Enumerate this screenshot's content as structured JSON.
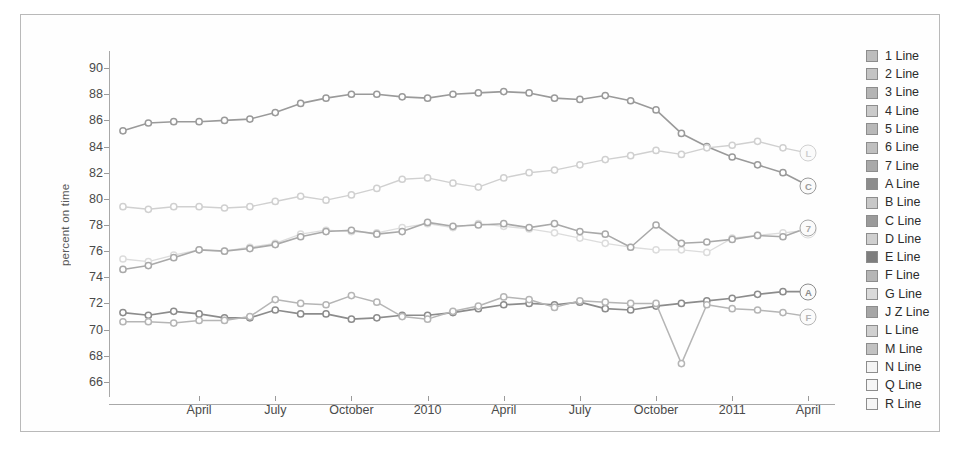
{
  "chart_data": {
    "type": "line",
    "title": "",
    "xlabel": "",
    "ylabel": "percent on time",
    "ylim": [
      65,
      91
    ],
    "yticks": [
      66,
      68,
      70,
      72,
      74,
      76,
      78,
      80,
      82,
      84,
      86,
      88,
      90
    ],
    "grid": false,
    "legend_position": "right",
    "x_tick_labels": [
      "April",
      "July",
      "October",
      "2010",
      "April",
      "July",
      "October",
      "2011",
      "April"
    ],
    "x_tick_months": [
      3,
      6,
      9,
      12,
      15,
      18,
      21,
      24,
      27
    ],
    "x": [
      "Jan 2009",
      "Feb 2009",
      "Mar 2009",
      "Apr 2009",
      "May 2009",
      "Jun 2009",
      "Jul 2009",
      "Aug 2009",
      "Sep 2009",
      "Oct 2009",
      "Nov 2009",
      "Dec 2009",
      "Jan 2010",
      "Feb 2010",
      "Mar 2010",
      "Apr 2010",
      "May 2010",
      "Jun 2010",
      "Jul 2010",
      "Aug 2010",
      "Sep 2010",
      "Oct 2010",
      "Nov 2010",
      "Dec 2010",
      "Jan 2011",
      "Feb 2011",
      "Mar 2011",
      "Apr 2011"
    ],
    "series": [
      {
        "name": "C Line",
        "end_label": "C",
        "color": "#9a9a9a",
        "width": 1.6,
        "values": [
          85.2,
          85.8,
          85.9,
          85.9,
          86.0,
          86.1,
          86.6,
          87.3,
          87.7,
          88.0,
          88.0,
          87.8,
          87.7,
          88.0,
          88.1,
          88.2,
          88.1,
          87.7,
          87.6,
          87.9,
          87.5,
          86.8,
          85.0,
          84.0,
          83.2,
          82.6,
          82.0,
          81.0
        ]
      },
      {
        "name": "L Line",
        "end_label": "L",
        "color": "#d0d0d0",
        "width": 1.4,
        "values": [
          79.4,
          79.2,
          79.4,
          79.4,
          79.3,
          79.4,
          79.8,
          80.2,
          79.9,
          80.3,
          80.8,
          81.5,
          81.6,
          81.2,
          80.9,
          81.6,
          82.0,
          82.2,
          82.6,
          83.0,
          83.3,
          83.7,
          83.4,
          83.9,
          84.1,
          84.4,
          83.9,
          83.5
        ]
      },
      {
        "name": "M Line",
        "end_label": "M",
        "color": "#dcdcdc",
        "width": 1.3,
        "values": [
          75.4,
          75.2,
          75.7,
          76.1,
          76.0,
          76.3,
          76.6,
          77.3,
          77.6,
          77.5,
          77.4,
          77.8,
          78.1,
          77.8,
          78.1,
          77.9,
          77.7,
          77.4,
          77.0,
          76.6,
          76.3,
          76.1,
          76.1,
          75.9,
          77.0,
          77.2,
          77.4,
          77.6
        ]
      },
      {
        "name": "7 Line",
        "end_label": "7",
        "color": "#a9a9a9",
        "width": 1.6,
        "values": [
          74.6,
          74.9,
          75.5,
          76.1,
          76.0,
          76.2,
          76.5,
          77.1,
          77.5,
          77.6,
          77.3,
          77.5,
          78.2,
          77.9,
          78.0,
          78.1,
          77.8,
          78.1,
          77.5,
          77.3,
          76.3,
          78.0,
          76.6,
          76.7,
          76.9,
          77.2,
          77.1,
          77.8
        ]
      },
      {
        "name": "A Line",
        "end_label": "A",
        "color": "#8c8c8c",
        "width": 1.7,
        "values": [
          71.3,
          71.1,
          71.4,
          71.2,
          70.9,
          70.9,
          71.5,
          71.2,
          71.2,
          70.8,
          70.9,
          71.1,
          71.1,
          71.3,
          71.6,
          71.9,
          72.0,
          71.9,
          72.1,
          71.6,
          71.5,
          71.8,
          72.0,
          72.2,
          72.4,
          72.7,
          72.9,
          72.9
        ]
      },
      {
        "name": "F Line",
        "end_label": "F",
        "color": "#b5b5b5",
        "width": 1.5,
        "values": [
          70.6,
          70.6,
          70.5,
          70.7,
          70.7,
          71.0,
          72.3,
          72.0,
          71.9,
          72.6,
          72.1,
          71.0,
          70.8,
          71.4,
          71.8,
          72.5,
          72.3,
          71.7,
          72.2,
          72.1,
          72.0,
          72.0,
          67.4,
          71.9,
          71.6,
          71.5,
          71.3,
          71.0
        ]
      }
    ]
  },
  "legend": {
    "items": [
      {
        "label": "1 Line",
        "swatch": "#bdbdbd"
      },
      {
        "label": "2 Line",
        "swatch": "#c4c4c4"
      },
      {
        "label": "3 Line",
        "swatch": "#b5b5b5"
      },
      {
        "label": "4 Line",
        "swatch": "#cacaca"
      },
      {
        "label": "5 Line",
        "swatch": "#b8b8b8"
      },
      {
        "label": "6 Line",
        "swatch": "#bfbfbf"
      },
      {
        "label": "7 Line",
        "swatch": "#a9a9a9"
      },
      {
        "label": "A Line",
        "swatch": "#8c8c8c"
      },
      {
        "label": "B Line",
        "swatch": "#c8c8c8"
      },
      {
        "label": "C Line",
        "swatch": "#9a9a9a"
      },
      {
        "label": "D Line",
        "swatch": "#cfcfcf"
      },
      {
        "label": "E Line",
        "swatch": "#7e7e7e"
      },
      {
        "label": "F Line",
        "swatch": "#b5b5b5"
      },
      {
        "label": "G Line",
        "swatch": "#dadada"
      },
      {
        "label": "J Z Line",
        "swatch": "#a6a6a6"
      },
      {
        "label": "L Line",
        "swatch": "#d0d0d0"
      },
      {
        "label": "M Line",
        "swatch": "#c2c2c2"
      },
      {
        "label": "N Line",
        "swatch": "#f4f4f4"
      },
      {
        "label": "Q Line",
        "swatch": "#f6f6f6"
      },
      {
        "label": "R Line",
        "swatch": "#f6f6f6"
      }
    ]
  }
}
